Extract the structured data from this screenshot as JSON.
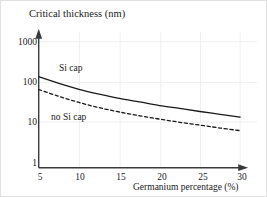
{
  "chart_data": {
    "type": "line",
    "title": "Critical thickness (nm)",
    "xlabel": "Germanium percentage (%)",
    "ylabel": "Critical thickness (nm)",
    "yscale": "log",
    "xlim": [
      5,
      30
    ],
    "ylim": [
      1,
      1000
    ],
    "grid": true,
    "legend_position": "inline-annotation",
    "xticks": [
      "5",
      "10",
      "15",
      "20",
      "25",
      "30"
    ],
    "xtick_values": [
      5,
      10,
      15,
      20,
      25,
      30
    ],
    "yticks": [
      "1",
      "10",
      "100",
      "1000"
    ],
    "ytick_values": [
      1,
      10,
      100,
      1000
    ],
    "x": [
      5,
      7.5,
      10,
      12.5,
      15,
      17.5,
      20,
      22.5,
      25,
      27.5,
      30
    ],
    "series": [
      {
        "name": "Si cap",
        "style": "solid",
        "color": "#1a1a1a",
        "values": [
          135,
          92,
          66,
          50,
          39,
          32,
          26,
          22,
          18.5,
          15.8,
          13.5
        ]
      },
      {
        "name": "no Si cap",
        "style": "dashed",
        "color": "#1a1a1a",
        "values": [
          65,
          44,
          31,
          23,
          18,
          14.5,
          12,
          10,
          8.5,
          7.2,
          6.2
        ]
      }
    ]
  },
  "axes": {
    "x_arrow": "arrow-right",
    "y_arrow": "arrow-up"
  },
  "colors": {
    "axis": "#3a3a3a",
    "grid": "#efefef",
    "text": "#1a1a1a",
    "background": "#ffffff",
    "border": "#e2e2e2"
  }
}
